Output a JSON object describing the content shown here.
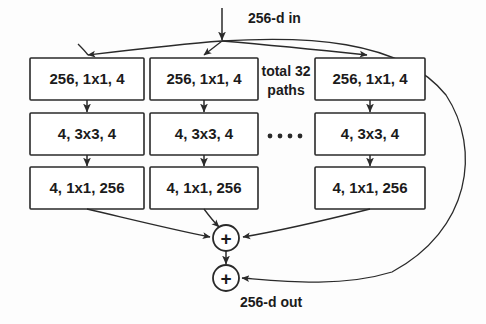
{
  "figure": {
    "colors": {
      "stroke": "#2a2a2a",
      "box_fill": "#ffffff",
      "text": "#1b1b1b",
      "background": "#fdfdfd"
    },
    "input_label": "256-d in",
    "output_label": "256-d out",
    "paths_note_line1": "total 32",
    "paths_note_line2": "paths",
    "ellipsis_dot_count": 4,
    "operator_symbol": "+",
    "columns": [
      {
        "name": "path-1",
        "boxes": [
          {
            "label": "256, 1x1, 4"
          },
          {
            "label": "4, 3x3, 4"
          },
          {
            "label": "4, 1x1, 256"
          }
        ]
      },
      {
        "name": "path-2",
        "boxes": [
          {
            "label": "256, 1x1, 4"
          },
          {
            "label": "4, 3x3, 4"
          },
          {
            "label": "4, 1x1, 256"
          }
        ]
      },
      {
        "name": "path-32",
        "boxes": [
          {
            "label": "256, 1x1, 4"
          },
          {
            "label": "4, 3x3, 4"
          },
          {
            "label": "4, 1x1, 256"
          }
        ]
      }
    ],
    "operators": [
      {
        "name": "aggregation-sum",
        "symbol": "+"
      },
      {
        "name": "residual-sum",
        "symbol": "+"
      }
    ]
  }
}
